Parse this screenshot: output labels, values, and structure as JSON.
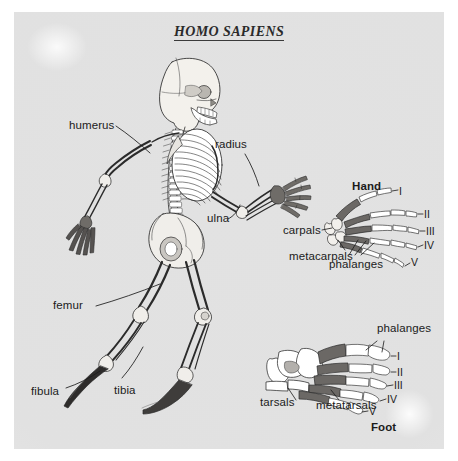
{
  "figure": {
    "title": "HOMO SAPIENS",
    "background_color": "#e1e1e1",
    "page_color": "#ffffff",
    "ink_color": "#1b1b1b",
    "bone_fill": "#ffffff",
    "bone_shaded": "#6e6e6e",
    "bone_mid": "#9a9a9a"
  },
  "skeleton": {
    "name": "human-skeleton-lateral",
    "labels": [
      {
        "id": "humerus",
        "text": "humerus"
      },
      {
        "id": "radius",
        "text": "radius"
      },
      {
        "id": "ulna",
        "text": "ulna"
      },
      {
        "id": "femur",
        "text": "femur"
      },
      {
        "id": "tibia",
        "text": "tibia"
      },
      {
        "id": "fibula",
        "text": "fibula"
      }
    ]
  },
  "hand": {
    "heading": "Hand",
    "labels": [
      {
        "id": "carpals",
        "text": "carpals"
      },
      {
        "id": "metacarpals",
        "text": "metacarpals"
      },
      {
        "id": "phalanges",
        "text": "phalanges"
      }
    ],
    "digits": [
      "I",
      "II",
      "III",
      "IV",
      "V"
    ]
  },
  "foot": {
    "heading": "Foot",
    "labels": [
      {
        "id": "phalanges",
        "text": "phalanges"
      },
      {
        "id": "tarsals",
        "text": "tarsals"
      },
      {
        "id": "metatarsals",
        "text": "metatarsals"
      }
    ],
    "digits": [
      "I",
      "II",
      "III",
      "IV",
      "V"
    ]
  }
}
